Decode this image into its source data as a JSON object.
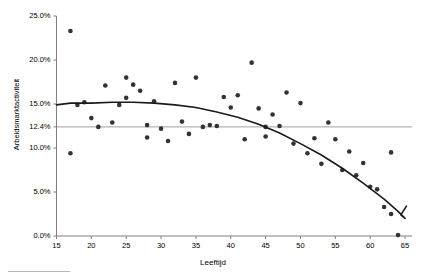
{
  "chart_data": {
    "type": "scatter",
    "title": "",
    "xlabel": "Leeftijd",
    "ylabel": "Arbeidsmarktactiviteit",
    "xlim": [
      15,
      66
    ],
    "ylim": [
      0,
      25
    ],
    "grid": false,
    "legend": null,
    "x_ticks": [
      "15",
      "20",
      "25",
      "30",
      "35",
      "40",
      "45",
      "50",
      "55",
      "60",
      "65"
    ],
    "x_tick_values": [
      15,
      20,
      25,
      30,
      35,
      40,
      45,
      50,
      55,
      60,
      65
    ],
    "y_ticks": [
      "0.0%",
      "5.0%",
      "10.0%",
      "12.4%",
      "15.0%",
      "20.0%",
      "25.0%"
    ],
    "y_tick_values": [
      0,
      5,
      10,
      12.4,
      15,
      20,
      25
    ],
    "reference_line": {
      "label": "12.4%",
      "value": 12.4,
      "color": "#b3b3b3"
    },
    "series": [
      {
        "name": "observaties",
        "type": "scatter",
        "color": "#333333",
        "points": [
          [
            17,
            23.3
          ],
          [
            17,
            9.4
          ],
          [
            18,
            14.9
          ],
          [
            19,
            15.2
          ],
          [
            20,
            13.4
          ],
          [
            21,
            12.4
          ],
          [
            22,
            17.1
          ],
          [
            23,
            12.9
          ],
          [
            24,
            14.9
          ],
          [
            25,
            18.0
          ],
          [
            25,
            15.7
          ],
          [
            26,
            17.2
          ],
          [
            27,
            16.5
          ],
          [
            28,
            12.6
          ],
          [
            28,
            11.2
          ],
          [
            29,
            15.3
          ],
          [
            30,
            12.2
          ],
          [
            31,
            10.8
          ],
          [
            32,
            17.4
          ],
          [
            33,
            13.0
          ],
          [
            34,
            11.6
          ],
          [
            35,
            18.0
          ],
          [
            36,
            12.4
          ],
          [
            37,
            12.6
          ],
          [
            38,
            12.5
          ],
          [
            39,
            15.8
          ],
          [
            40,
            14.6
          ],
          [
            41,
            16.0
          ],
          [
            42,
            11.0
          ],
          [
            43,
            19.7
          ],
          [
            44,
            14.5
          ],
          [
            45,
            12.4
          ],
          [
            45,
            11.3
          ],
          [
            46,
            13.8
          ],
          [
            47,
            12.5
          ],
          [
            48,
            16.3
          ],
          [
            49,
            10.5
          ],
          [
            50,
            15.1
          ],
          [
            51,
            9.4
          ],
          [
            52,
            11.1
          ],
          [
            53,
            8.2
          ],
          [
            54,
            12.9
          ],
          [
            55,
            11.0
          ],
          [
            56,
            7.5
          ],
          [
            57,
            9.6
          ],
          [
            58,
            6.9
          ],
          [
            59,
            8.3
          ],
          [
            60,
            5.6
          ],
          [
            61,
            5.3
          ],
          [
            62,
            3.3
          ],
          [
            63,
            9.5
          ],
          [
            63,
            2.5
          ],
          [
            64,
            0.1
          ]
        ]
      },
      {
        "name": "trendlijn",
        "type": "line",
        "color": "#1a1a1a",
        "points": [
          [
            15,
            14.9
          ],
          [
            17,
            15.1
          ],
          [
            20,
            15.1
          ],
          [
            23,
            15.2
          ],
          [
            26,
            15.2
          ],
          [
            29,
            15.1
          ],
          [
            32,
            14.9
          ],
          [
            35,
            14.6
          ],
          [
            38,
            14.1
          ],
          [
            41,
            13.5
          ],
          [
            44,
            12.7
          ],
          [
            47,
            11.7
          ],
          [
            50,
            10.5
          ],
          [
            53,
            9.2
          ],
          [
            56,
            7.7
          ],
          [
            59,
            6.0
          ],
          [
            62,
            4.2
          ],
          [
            64,
            2.8
          ],
          [
            65,
            2.0
          ],
          [
            64.4,
            2.4
          ],
          [
            65.2,
            3.4
          ]
        ]
      }
    ]
  }
}
